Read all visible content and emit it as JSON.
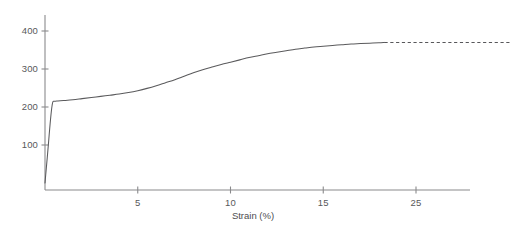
{
  "chart_data": {
    "type": "line",
    "title": "",
    "subtitle": "",
    "xlabel": "Strain (%)",
    "ylabel": "",
    "xlim": [
      0,
      28
    ],
    "ylim": [
      0,
      440
    ],
    "grid": false,
    "legend": null,
    "x_ticks": [
      {
        "value": 5,
        "label": "5"
      },
      {
        "value": 10,
        "label": "10"
      },
      {
        "value": 15,
        "label": "15"
      },
      {
        "value": 20,
        "label": "25"
      }
    ],
    "y_ticks": [
      {
        "value": 100,
        "label": "100"
      },
      {
        "value": 200,
        "label": "200"
      },
      {
        "value": 300,
        "label": "300"
      },
      {
        "value": 400,
        "label": "400"
      }
    ],
    "series": [
      {
        "name": "stress-strain-curve",
        "style": "solid",
        "color": "#5a5a5c",
        "x": [
          0,
          0.05,
          0.12,
          0.2,
          0.28,
          0.36,
          0.42,
          0.5,
          0.7,
          1.0,
          1.5,
          2.0,
          2.5,
          3.0,
          3.5,
          4.0,
          4.5,
          5.0,
          5.5,
          6.0,
          6.5,
          7.0,
          7.5,
          8.0,
          8.5,
          9.0,
          9.5,
          10.0,
          10.5,
          11.0,
          11.5,
          12.0,
          12.5,
          13.0,
          13.5,
          14.0,
          14.5,
          15.0,
          15.5,
          16.0,
          16.5,
          17.0,
          17.5,
          18.0,
          18.3
        ],
        "y": [
          0,
          28,
          66,
          112,
          158,
          196,
          213,
          215,
          216,
          217,
          219,
          222,
          225,
          228,
          231,
          234,
          238,
          243,
          249,
          256,
          264,
          272,
          281,
          290,
          298,
          305,
          312,
          318,
          324,
          330,
          335,
          340,
          344,
          348,
          352,
          355,
          358,
          360,
          362,
          364,
          366,
          367,
          368,
          369,
          370
        ]
      },
      {
        "name": "extrapolated-extension",
        "style": "dashed",
        "color": "#57575a",
        "x": [
          18.3,
          20,
          22,
          24,
          26,
          27.5
        ],
        "y": [
          370,
          370,
          370,
          370,
          370,
          370
        ]
      }
    ],
    "annotations": [
      {
        "name": "fracture-marker",
        "symbol": "✕",
        "x": 28.2,
        "y": 370,
        "arrowhead": true
      }
    ]
  },
  "axes": {
    "x_axis_color": "#8a8a8c",
    "y_axis_color": "#8a8a8c",
    "tick_color": "#8a8a8c",
    "label_color": "#58585a"
  }
}
